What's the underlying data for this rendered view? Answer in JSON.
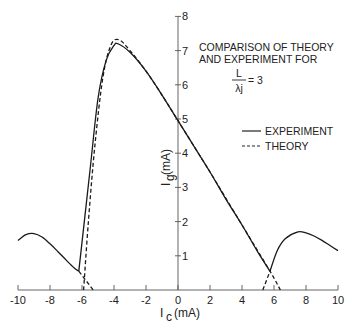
{
  "chart_data": {
    "type": "line",
    "title": "",
    "xlabel": "I_c (mA)",
    "ylabel": "I_g (mA)",
    "xlim": [
      -10,
      10
    ],
    "ylim": [
      0,
      8
    ],
    "x_ticks": [
      -10,
      -8,
      -6,
      -4,
      -2,
      0,
      2,
      4,
      6,
      8,
      10
    ],
    "y_ticks": [
      1,
      2,
      3,
      4,
      5,
      6,
      7,
      8
    ],
    "grid": false,
    "legend_position": "right-middle",
    "annotations": [
      "COMPARISON OF THEORY",
      "AND EXPERIMENT FOR",
      "L/λj = 3"
    ],
    "series": [
      {
        "name": "EXPERIMENT",
        "style": "solid",
        "points": [
          [
            -10,
            1.45
          ],
          [
            -9.5,
            1.62
          ],
          [
            -9,
            1.65
          ],
          [
            -8.5,
            1.55
          ],
          [
            -8,
            1.35
          ],
          [
            -7.5,
            1.12
          ],
          [
            -7,
            0.88
          ],
          [
            -6.5,
            0.65
          ],
          [
            -6.2,
            0.55
          ],
          [
            -5.5,
            3.5
          ],
          [
            -5.0,
            5.6
          ],
          [
            -4.5,
            6.7
          ],
          [
            -4.0,
            7.15
          ],
          [
            -3.75,
            7.2
          ],
          [
            -3.0,
            6.95
          ],
          [
            -2.0,
            6.4
          ],
          [
            -1.0,
            5.7
          ],
          [
            0,
            4.95
          ],
          [
            1.0,
            4.2
          ],
          [
            2.0,
            3.45
          ],
          [
            3.0,
            2.65
          ],
          [
            4.0,
            1.9
          ],
          [
            5.0,
            1.1
          ],
          [
            5.75,
            0.55
          ],
          [
            6.2,
            1.15
          ],
          [
            6.7,
            1.5
          ],
          [
            7.5,
            1.7
          ],
          [
            8.0,
            1.67
          ],
          [
            8.5,
            1.58
          ],
          [
            9.0,
            1.45
          ],
          [
            9.5,
            1.3
          ],
          [
            10,
            1.15
          ]
        ]
      },
      {
        "name": "THEORY",
        "style": "dashed",
        "points": [
          [
            -5.9,
            0.0
          ],
          [
            -5.6,
            2.0
          ],
          [
            -5.2,
            4.2
          ],
          [
            -4.7,
            6.2
          ],
          [
            -4.2,
            7.15
          ],
          [
            -3.7,
            7.32
          ],
          [
            -3.0,
            7.0
          ],
          [
            -2.0,
            6.4
          ],
          [
            -1.0,
            5.7
          ],
          [
            0,
            4.95
          ],
          [
            2.0,
            3.45
          ],
          [
            4.0,
            1.9
          ],
          [
            5.75,
            0.55
          ],
          [
            6.4,
            0.0
          ]
        ],
        "extra_segments": [
          [
            [
              -6.2,
              0.55
            ],
            [
              -5.3,
              0.0
            ]
          ],
          [
            [
              5.3,
              0.0
            ],
            [
              5.75,
              0.55
            ]
          ]
        ]
      }
    ]
  },
  "labels": {
    "annot_line1": "COMPARISON OF THEORY",
    "annot_line2": "AND EXPERIMENT FOR",
    "annot_frac_num": "L",
    "annot_frac_den": "λj",
    "annot_eq": "= 3",
    "legend_experiment": "EXPERIMENT",
    "legend_theory": "THEORY",
    "xlabel_main": "I",
    "xlabel_sub": "c",
    "xlabel_unit": "(mA)",
    "ylabel_main": "I",
    "ylabel_sub": "g",
    "ylabel_unit": "(mA)"
  }
}
